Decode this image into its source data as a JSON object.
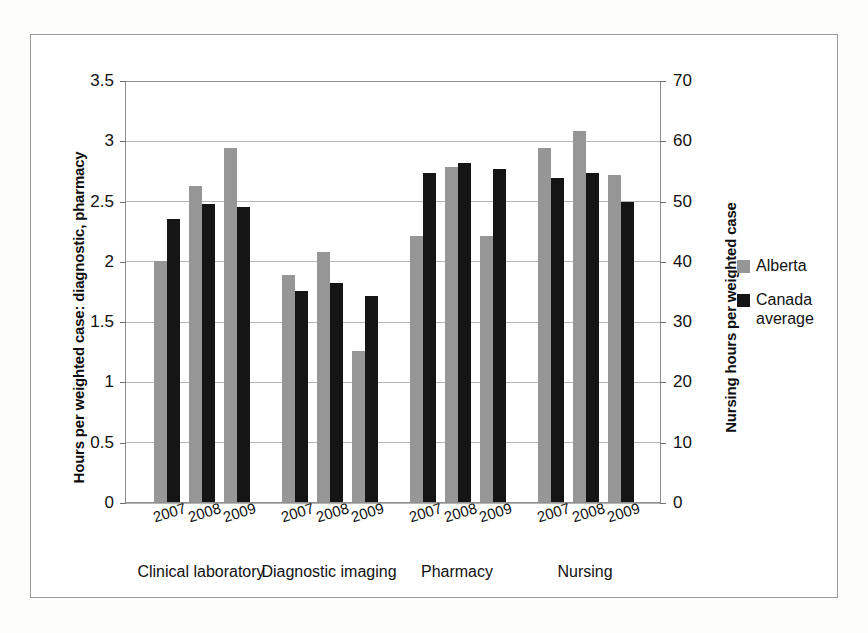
{
  "chart_data": {
    "type": "bar",
    "title": "",
    "subtitle": "",
    "categories": [
      "2007",
      "2008",
      "2009"
    ],
    "groups": [
      "Clinical laboratory",
      "Diagnostic imaging",
      "Pharmacy",
      "Nursing"
    ],
    "series": [
      {
        "name": "Alberta",
        "color": "#969696",
        "values_by_group": {
          "Clinical laboratory": [
            2.0,
            2.62,
            2.94
          ],
          "Diagnostic imaging": [
            1.88,
            2.07,
            1.25
          ],
          "Pharmacy": [
            2.21,
            2.78,
            2.21
          ],
          "Nursing": [
            58.8,
            61.5,
            54.2
          ]
        }
      },
      {
        "name": "Canada average",
        "color": "#151515",
        "values_by_group": {
          "Clinical laboratory": [
            2.35,
            2.47,
            2.45
          ],
          "Diagnostic imaging": [
            1.75,
            1.82,
            1.71
          ],
          "Pharmacy": [
            2.73,
            2.81,
            2.76
          ],
          "Nursing": [
            53.8,
            54.5,
            49.7
          ]
        }
      }
    ],
    "left_axis": {
      "label": "Hours per weighted case: diagnostic, pharmacy",
      "ticks": [
        "0",
        "0.5",
        "1",
        "1.5",
        "2",
        "2.5",
        "3",
        "3.5"
      ],
      "values": [
        0,
        0.5,
        1,
        1.5,
        2,
        2.5,
        3,
        3.5
      ],
      "min": 0,
      "max": 3.5,
      "applies_to_groups": [
        "Clinical laboratory",
        "Diagnostic imaging",
        "Pharmacy"
      ]
    },
    "right_axis": {
      "label": "Nursing hours per weighted case",
      "ticks": [
        "0",
        "10",
        "20",
        "30",
        "40",
        "50",
        "60",
        "70"
      ],
      "values": [
        0,
        10,
        20,
        30,
        40,
        50,
        60,
        70
      ],
      "min": 0,
      "max": 70,
      "applies_to_groups": [
        "Nursing"
      ]
    },
    "xlabel": "",
    "grid": true,
    "legend_position": "right",
    "legend": [
      {
        "label": "Alberta",
        "color": "#969696"
      },
      {
        "label": "Canada average",
        "color": "#151515"
      }
    ]
  },
  "legend_entries": [
    {
      "label": "Alberta",
      "line1": "Alberta",
      "line2": ""
    },
    {
      "label": "Canada average",
      "line1": "Canada",
      "line2": "average"
    }
  ],
  "colors": {
    "alberta": "#969696",
    "canada_average": "#151515",
    "gridline": "#b5b5b5",
    "axis": "#8e8e8e",
    "frame": "#9a9a9a",
    "background": "#ffffff"
  }
}
